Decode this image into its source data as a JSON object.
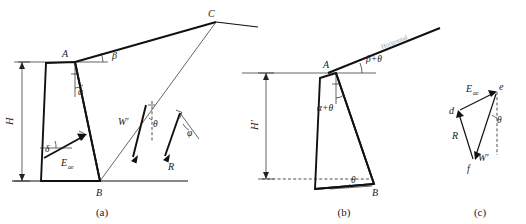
{
  "figure": {
    "panels": [
      {
        "id": "a",
        "caption": "(a)",
        "description": "Retaining wall with sloping backfill, failure wedge and forces",
        "points": [
          {
            "name": "A",
            "label": "A",
            "role": "wall-crest"
          },
          {
            "name": "B",
            "label": "B",
            "role": "wall-heel"
          },
          {
            "name": "C",
            "label": "C",
            "role": "failure-surface-apex"
          }
        ],
        "dimensions": [
          {
            "name": "H",
            "label": "H",
            "role": "wall-height"
          }
        ],
        "angles": [
          {
            "name": "beta",
            "label": "β",
            "role": "backfill-slope-angle"
          },
          {
            "name": "alpha",
            "label": "α",
            "role": "wall-batter-angle"
          },
          {
            "name": "delta",
            "label": "δ",
            "role": "wall-friction-angle"
          },
          {
            "name": "theta",
            "label": "θ",
            "role": "seismic-inertia-angle"
          },
          {
            "name": "phi",
            "label": "φ",
            "role": "soil-friction-angle"
          }
        ],
        "forces": [
          {
            "name": "Eae",
            "label": "E",
            "subscript": "ae",
            "role": "seismic-active-earth-pressure"
          },
          {
            "name": "Wprime",
            "label": "W′",
            "role": "modified-weight-of-wedge"
          },
          {
            "name": "R",
            "label": "R",
            "role": "resultant-soil-reaction"
          }
        ]
      },
      {
        "id": "b",
        "caption": "(b)",
        "description": "Equivalent rotated system by angle theta",
        "points": [
          {
            "name": "A",
            "label": "A",
            "role": "wall-crest"
          },
          {
            "name": "B",
            "label": "B",
            "role": "wall-heel"
          }
        ],
        "dimensions": [
          {
            "name": "Hprime",
            "label": "H′",
            "role": "rotated-wall-height"
          }
        ],
        "angles": [
          {
            "name": "beta-plus-theta",
            "label": "β+θ",
            "role": "rotated-backfill-slope-angle"
          },
          {
            "name": "alpha-plus-theta",
            "label": "α+θ",
            "role": "rotated-wall-batter-angle"
          },
          {
            "name": "theta",
            "label": "θ",
            "role": "rotation-angle"
          }
        ],
        "annotations": [
          {
            "name": "horizontal-reference",
            "label": "Horizontal",
            "role": "rotated-horizontal-line"
          }
        ]
      },
      {
        "id": "c",
        "caption": "(c)",
        "description": "Force polygon for the failure wedge",
        "points": [
          {
            "name": "d",
            "label": "d",
            "role": "force-triangle-vertex-d"
          },
          {
            "name": "e",
            "label": "e",
            "role": "force-triangle-vertex-e"
          },
          {
            "name": "f",
            "label": "f",
            "role": "force-triangle-vertex-f"
          }
        ],
        "angles": [
          {
            "name": "theta",
            "label": "θ",
            "role": "seismic-inertia-angle"
          }
        ],
        "forces": [
          {
            "name": "Eae",
            "label": "E",
            "subscript": "ae",
            "role": "seismic-active-earth-pressure"
          },
          {
            "name": "R",
            "label": "R",
            "role": "resultant-soil-reaction"
          },
          {
            "name": "Wprime",
            "label": "W′",
            "role": "modified-weight-of-wedge"
          }
        ]
      }
    ]
  },
  "colors": {
    "ink": "#111111",
    "thin_ink": "#222222",
    "faint": "#9a9a9a",
    "background": "#ffffff"
  }
}
